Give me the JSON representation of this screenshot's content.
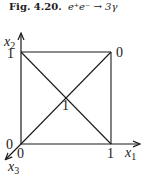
{
  "title": {
    "fig_label": "Fig. 4.20.",
    "equation": "e⁺e⁻ → 3γ"
  },
  "axes": {
    "x1_label": "x",
    "x1_sub": "1",
    "x2_label": "x",
    "x2_sub": "2",
    "x3_label": "x",
    "x3_sub": "3"
  },
  "vertex_labels": {
    "top_left": "1",
    "top_right": "0",
    "center": "1",
    "origin_left": "0",
    "origin_below": "0",
    "bottom_right": "1"
  },
  "colors": {
    "ink": "#1a1a1a",
    "background": "#ffffff"
  }
}
